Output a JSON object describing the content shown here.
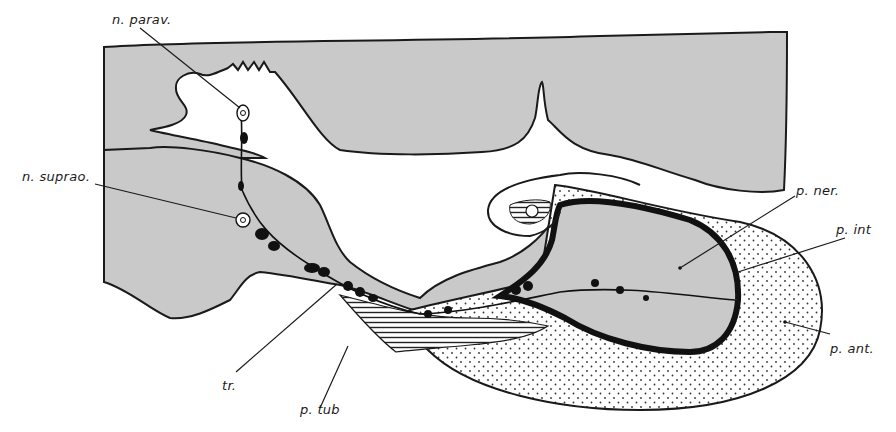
{
  "figure": {
    "type": "anatomical line drawing",
    "colors": {
      "tissue_fill": "#c9c9c9",
      "outline": "#1a1a1a",
      "background": "#ffffff",
      "dense_fill": "#111111"
    },
    "labels": {
      "n_parav": "n. parav.",
      "n_suprao": "n. suprao.",
      "p_ner": "p. ner.",
      "p_int": "p. int",
      "p_ant": "p. ant.",
      "tr": "tr.",
      "p_tub": "p. tub"
    },
    "caption_fragment": ""
  }
}
